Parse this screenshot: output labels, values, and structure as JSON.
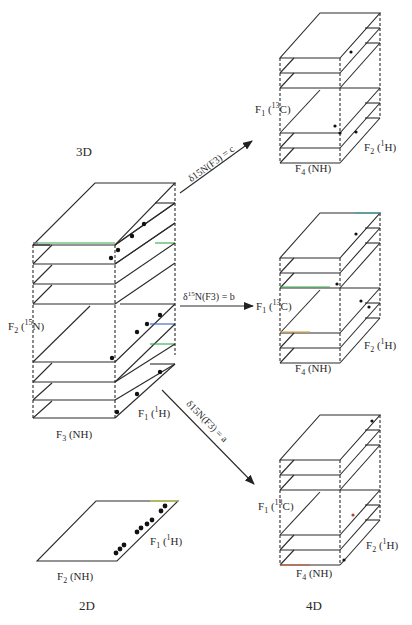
{
  "titles": {
    "three_d": "3D",
    "two_d": "2D",
    "four_d": "4D"
  },
  "three_d_cube": {
    "axis_f1": "F1 (1H)",
    "axis_f1_main": "F",
    "axis_f1_sub": "1",
    "axis_f1_rest": " (",
    "axis_f1_sup": "1",
    "axis_f1_tail": "H)",
    "axis_f2_main": "F",
    "axis_f2_sub": "2",
    "axis_f2_rest": " (",
    "axis_f2_sup": "15",
    "axis_f2_tail": "N)",
    "axis_f3_main": "F",
    "axis_f3_sub": "3",
    "axis_f3_tail": " (NH)"
  },
  "arrows": [
    {
      "label_pre": "δ15N(F3) = ",
      "value": "c",
      "label": "δ15N(F3) = c"
    },
    {
      "label_pre": "δ15N(F3) = ",
      "value": "b",
      "label": "δ15N(F3) = b"
    },
    {
      "label_pre": "δ15N(F3) = ",
      "value": "a",
      "label": "δ15N(F3) = a"
    }
  ],
  "four_d_cubes": [
    {
      "id": "c",
      "f1": "F1 (13C)",
      "f2": "F2 (1H)",
      "f4": "F4 (NH)"
    },
    {
      "id": "b",
      "f1": "F1 (13C)",
      "f2": "F2 (1H)",
      "f4": "F4 (NH)"
    },
    {
      "id": "a",
      "f1": "F1 (13C)",
      "f2": "F2 (1H)",
      "f4": "F4 (NH)"
    }
  ],
  "two_d_plane": {
    "f1": "F1 (1H)",
    "f2": "F2 (NH)"
  },
  "labels": {
    "F": "F",
    "one": "1",
    "two": "2",
    "three": "3",
    "four": "4",
    "open": " (",
    "sup1": "1",
    "sup13": "13",
    "sup15": "15",
    "H": "H)",
    "C": "C)",
    "N": "N)",
    "NH": " (NH)",
    "delta": "δ",
    "d15N": "15",
    "NF3": "N(F",
    "close_eq": ") = "
  }
}
